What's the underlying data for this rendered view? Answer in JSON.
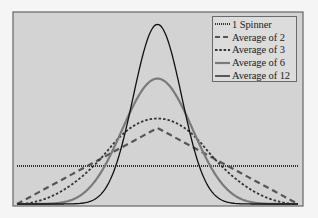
{
  "chart_data": {
    "type": "line",
    "title": "",
    "xlabel": "",
    "ylabel": "",
    "xlim": [
      0,
      1
    ],
    "ylim": [
      0,
      5
    ],
    "grid": false,
    "legend_position": "upper right",
    "series": [
      {
        "name": "1 Spinner",
        "n": 1,
        "style": "dotted",
        "color": "#333333",
        "width": 2.2,
        "peak_density": 1.0
      },
      {
        "name": "Average of 2",
        "n": 2,
        "style": "dashed",
        "color": "#555555",
        "width": 2.2,
        "peak_density": 2.0
      },
      {
        "name": "Average of 3",
        "n": 3,
        "style": "short-dashed",
        "color": "#333333",
        "width": 1.8,
        "peak_density": 2.25
      },
      {
        "name": "Average of 6",
        "n": 6,
        "style": "solid",
        "color": "#7a7a7a",
        "width": 2.2,
        "peak_density": 3.3
      },
      {
        "name": "Average of 12",
        "n": 12,
        "style": "solid",
        "color": "#111111",
        "width": 1.3,
        "peak_density": 4.8
      }
    ]
  },
  "colors": {
    "plot_background": "#d3d3d3",
    "frame": "#666666",
    "page_background": "#f5f5f5"
  }
}
